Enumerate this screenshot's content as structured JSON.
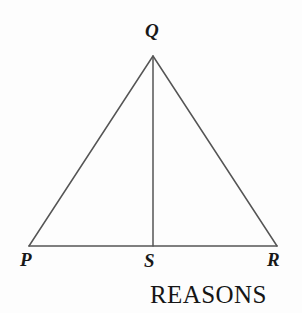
{
  "figure": {
    "background_color": "#fdfdfd",
    "stroke_color": "#555555",
    "text_color": "#181818",
    "width": 302,
    "height": 313
  },
  "labels": {
    "apex": "Q",
    "left": "P",
    "midpoint": "S",
    "right": "R"
  },
  "caption": {
    "text": "REASONS"
  },
  "geometry": {
    "points": {
      "Q": {
        "x": 153,
        "y": 56
      },
      "P": {
        "x": 29,
        "y": 246
      },
      "S": {
        "x": 153,
        "y": 246
      },
      "R": {
        "x": 277,
        "y": 246
      }
    },
    "segments": [
      {
        "name": "PQ",
        "from": "P",
        "to": "Q"
      },
      {
        "name": "QR",
        "from": "Q",
        "to": "R"
      },
      {
        "name": "PR",
        "from": "P",
        "to": "R"
      },
      {
        "name": "QS",
        "from": "Q",
        "to": "S"
      }
    ],
    "stroke_width": 1.5
  }
}
